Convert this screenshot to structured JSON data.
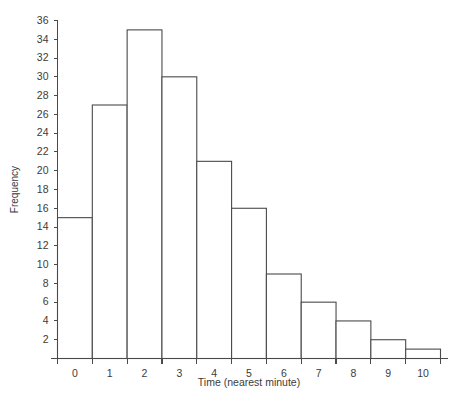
{
  "chart_data": {
    "type": "bar",
    "title": "",
    "subtitle": "",
    "xlabel": "Time (nearest minute)",
    "ylabel": "Frequency",
    "categories": [
      "0",
      "1",
      "2",
      "3",
      "4",
      "5",
      "6",
      "7",
      "8",
      "9",
      "10"
    ],
    "values": [
      15,
      27,
      35,
      30,
      21,
      16,
      9,
      6,
      4,
      2,
      1
    ],
    "ylim": [
      0,
      36
    ],
    "xlim": [
      -0.5,
      10.5
    ],
    "ytick_labels": [
      "2",
      "4",
      "6",
      "8",
      "10",
      "12",
      "14",
      "16",
      "18",
      "20",
      "22",
      "24",
      "26",
      "28",
      "30",
      "32",
      "34",
      "36"
    ],
    "ytick_values": [
      2,
      4,
      6,
      8,
      10,
      12,
      14,
      16,
      18,
      20,
      22,
      24,
      26,
      28,
      30,
      32,
      34,
      36
    ],
    "xtick_labels": [
      "0",
      "1",
      "2",
      "3",
      "4",
      "5",
      "6",
      "7",
      "8",
      "9",
      "10"
    ],
    "grid": false,
    "legend": false,
    "legend_position": "none",
    "bar_fill_color": "#ffffff",
    "bar_stroke_color": "#4a4a4a",
    "axis_color": "#4a4a4a",
    "text_color": "#3b3b3b",
    "background_color": "#ffffff"
  }
}
